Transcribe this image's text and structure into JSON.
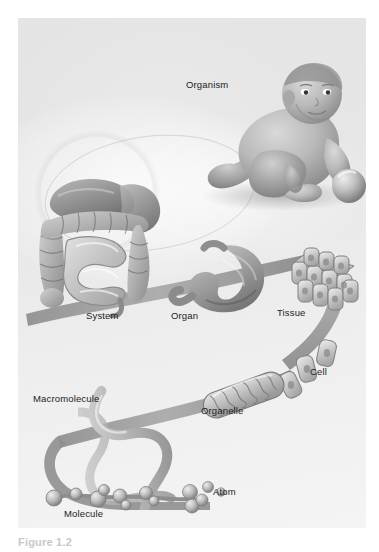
{
  "figure": {
    "caption": "Figure 1.2",
    "panel_background": "#e8e8e8",
    "label_color": "#1c1c1c",
    "ribbon_color": "#9a9a9a"
  },
  "labels": [
    {
      "id": "organism",
      "text": "Organism",
      "x": 186,
      "y": 79
    },
    {
      "id": "system",
      "text": "System",
      "x": 86,
      "y": 310
    },
    {
      "id": "organ",
      "text": "Organ",
      "x": 171,
      "y": 310
    },
    {
      "id": "tissue",
      "text": "Tissue",
      "x": 277,
      "y": 307
    },
    {
      "id": "cell",
      "text": "Cell",
      "x": 310,
      "y": 366
    },
    {
      "id": "organelle",
      "text": "Organelle",
      "x": 201,
      "y": 405
    },
    {
      "id": "macromolecule",
      "text": "Macromolecule",
      "x": 33,
      "y": 393
    },
    {
      "id": "molecule",
      "text": "Molecule",
      "x": 64,
      "y": 508
    },
    {
      "id": "atom",
      "text": "Atom",
      "x": 213,
      "y": 486
    }
  ],
  "illustration": {
    "organism": "human-infant-crawling-with-ball",
    "system": "digestive-system",
    "organ": "stomach",
    "tissue": "epithelial-tissue-block",
    "cell": "individual-cells",
    "organelle": "mitochondrion",
    "macromolecule": "dna-double-helix",
    "molecule": "ball-and-stick-molecule",
    "atom": "atom-spheres"
  }
}
